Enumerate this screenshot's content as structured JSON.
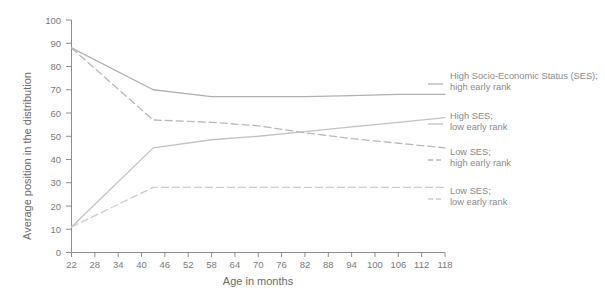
{
  "chart_data": {
    "type": "line",
    "title": "",
    "xlabel": "Age in months",
    "ylabel": "Average position in the distribution",
    "xlim": [
      22,
      118
    ],
    "ylim": [
      0,
      100
    ],
    "grid": false,
    "legend_position": "right",
    "x_ticks": [
      22,
      28,
      34,
      40,
      46,
      52,
      58,
      64,
      70,
      76,
      82,
      88,
      94,
      100,
      106,
      112,
      118
    ],
    "y_ticks": [
      0,
      10,
      20,
      30,
      40,
      50,
      60,
      70,
      80,
      90,
      100
    ],
    "x": [
      22,
      43,
      58,
      70,
      82,
      94,
      106,
      118
    ],
    "series": [
      {
        "name": "High Socio-Economic Status (SES); high early rank",
        "legend_line1": "High Socio-Economic Status (SES);",
        "legend_line2": "high early rank",
        "style": "solid",
        "color": "#b0b0b0",
        "values": [
          88,
          70,
          67,
          67,
          67,
          67.5,
          68,
          68
        ]
      },
      {
        "name": "High SES; low early rank",
        "legend_line1": "High SES;",
        "legend_line2": "low early rank",
        "style": "solid",
        "color": "#c2c2c2",
        "values": [
          11,
          45,
          48.5,
          50,
          52,
          54,
          56,
          58
        ]
      },
      {
        "name": "Low SES; high early rank",
        "legend_line1": "Low SES;",
        "legend_line2": "high early rank",
        "style": "dashed",
        "color": "#b8b8b8",
        "values": [
          88,
          57,
          56,
          54.5,
          51.5,
          49,
          47,
          45
        ]
      },
      {
        "name": "Low SES; low early rank",
        "legend_line1": "Low SES;",
        "legend_line2": "low early rank",
        "style": "dashed",
        "color": "#cccccc",
        "values": [
          11,
          28,
          28,
          28,
          28,
          28,
          28,
          28
        ]
      }
    ]
  },
  "axes": {
    "x_title": "Age in months",
    "y_title": "Average position in the distribution"
  }
}
